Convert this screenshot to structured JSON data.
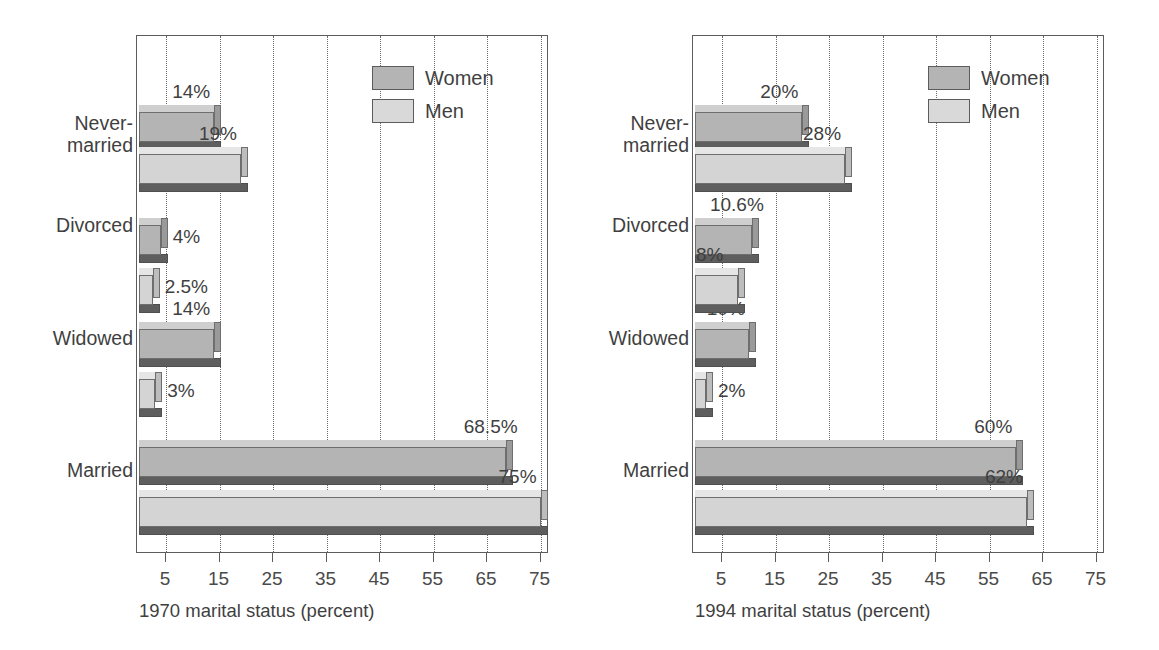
{
  "chart_data": [
    {
      "type": "bar",
      "orientation": "horizontal",
      "title": "",
      "xlabel": "1970 marital status (percent)",
      "ylabel": "",
      "categories": [
        "Never-\nmarried",
        "Divorced",
        "Widowed",
        "Married"
      ],
      "series": [
        {
          "name": "Women",
          "values": [
            14,
            4,
            14,
            68.5
          ],
          "labels": [
            "14%",
            "4%",
            "14%",
            "68.5%"
          ],
          "color": "#b4b4b4"
        },
        {
          "name": "Men",
          "values": [
            19,
            2.5,
            3,
            75
          ],
          "labels": [
            "19%",
            "2.5%",
            "3%",
            "75%"
          ],
          "color": "#d9d9d9"
        }
      ],
      "xlim": [
        0,
        80
      ],
      "xticks": [
        5,
        15,
        25,
        35,
        45,
        55,
        65,
        75
      ],
      "xticklabels": [
        "5",
        "15",
        "25",
        "35",
        "45",
        "55",
        "65",
        "75"
      ],
      "grid": true,
      "grid_style": "dotted-vertical",
      "legend_position": "top-right",
      "style_3d": true
    },
    {
      "type": "bar",
      "orientation": "horizontal",
      "title": "",
      "xlabel": "1994 marital status (percent)",
      "ylabel": "",
      "categories": [
        "Never-\nmarried",
        "Divorced",
        "Widowed",
        "Married"
      ],
      "series": [
        {
          "name": "Women",
          "values": [
            20,
            10.6,
            10,
            60
          ],
          "labels": [
            "20%",
            "10.6%",
            "10%",
            "60%"
          ],
          "color": "#b4b4b4"
        },
        {
          "name": "Men",
          "values": [
            28,
            8,
            2,
            62
          ],
          "labels": [
            "28%",
            "8%",
            "2%",
            "62%"
          ],
          "color": "#d9d9d9"
        }
      ],
      "xlim": [
        0,
        80
      ],
      "xticks": [
        5,
        15,
        25,
        35,
        45,
        55,
        65,
        75
      ],
      "xticklabels": [
        "5",
        "15",
        "25",
        "35",
        "45",
        "55",
        "65",
        "75"
      ],
      "grid": true,
      "grid_style": "dotted-vertical",
      "legend_position": "top-right",
      "style_3d": true
    }
  ],
  "charts": [
    {
      "id": "chart-1970",
      "caption": "1970 marital status (percent)",
      "legend": {
        "women": "Women",
        "men": "Men"
      },
      "categories": [
        {
          "label": "Never-\nmarried",
          "women_label": "14%",
          "men_label": "19%"
        },
        {
          "label": "Divorced",
          "women_label": "4%",
          "men_label": "2.5%"
        },
        {
          "label": "Widowed",
          "women_label": "14%",
          "men_label": "3%"
        },
        {
          "label": "Married",
          "women_label": "68.5%",
          "men_label": "75%"
        }
      ],
      "axis_ticks": [
        "5",
        "15",
        "25",
        "35",
        "45",
        "55",
        "65",
        "75"
      ]
    },
    {
      "id": "chart-1994",
      "caption": "1994 marital status (percent)",
      "legend": {
        "women": "Women",
        "men": "Men"
      },
      "categories": [
        {
          "label": "Never-\nmarried",
          "women_label": "20%",
          "men_label": "28%"
        },
        {
          "label": "Divorced",
          "women_label": "10.6%",
          "men_label": "8%"
        },
        {
          "label": "Widowed",
          "women_label": "10%",
          "men_label": "2%"
        },
        {
          "label": "Married",
          "women_label": "60%",
          "men_label": "62%"
        }
      ],
      "axis_ticks": [
        "5",
        "15",
        "25",
        "35",
        "45",
        "55",
        "65",
        "75"
      ]
    }
  ],
  "colors": {
    "women_fill": "#b4b4b4",
    "men_fill": "#d9d9d9",
    "shadow": "#5e5e5e",
    "frame": "#5c5c5c",
    "grid": "#6b6b6b",
    "text": "#3f3f3f",
    "background": "#ffffff"
  }
}
